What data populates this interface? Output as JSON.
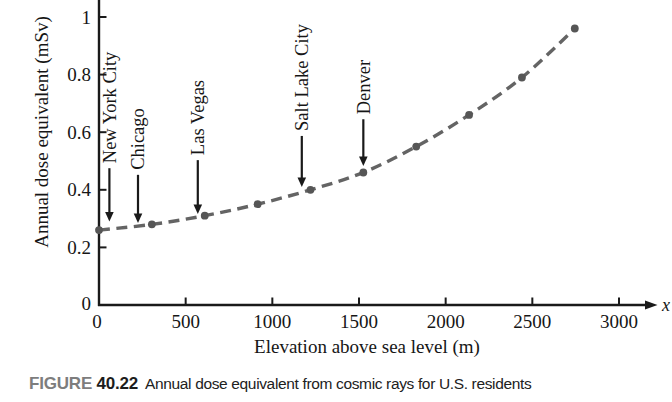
{
  "figure_caption": {
    "tag": "FIGURE",
    "number": "40.22",
    "text": "Annual dose equivalent from cosmic rays for U.S. residents"
  },
  "chart_data": {
    "type": "line",
    "title": "",
    "xlabel": "Elevation above sea level (m)",
    "ylabel": "Annual dose equivalent (mSv)",
    "x_axis_end_symbol": "x",
    "xlim": [
      0,
      3100
    ],
    "ylim": [
      0,
      1.05
    ],
    "x_ticks": [
      0,
      500,
      1000,
      1500,
      2000,
      2500,
      3000
    ],
    "y_ticks": [
      0,
      0.2,
      0.4,
      0.6,
      0.8,
      1
    ],
    "grid": false,
    "legend": "none",
    "line_style": "dashed",
    "colors": {
      "curve": "#646464",
      "points": "#565656",
      "axis": "#1a1a1a",
      "text": "#161616"
    },
    "points": [
      {
        "elevation_m": 0,
        "dose_mSv": 0.26
      },
      {
        "elevation_m": 305,
        "dose_mSv": 0.28
      },
      {
        "elevation_m": 610,
        "dose_mSv": 0.31
      },
      {
        "elevation_m": 915,
        "dose_mSv": 0.35
      },
      {
        "elevation_m": 1220,
        "dose_mSv": 0.4
      },
      {
        "elevation_m": 1525,
        "dose_mSv": 0.46
      },
      {
        "elevation_m": 1830,
        "dose_mSv": 0.55
      },
      {
        "elevation_m": 2135,
        "dose_mSv": 0.66
      },
      {
        "elevation_m": 2440,
        "dose_mSv": 0.79
      },
      {
        "elevation_m": 2745,
        "dose_mSv": 0.96
      }
    ],
    "annotations": [
      {
        "label": "New York City",
        "elevation_m": 60,
        "arrow_tip_dose": 0.29,
        "arrow_tail_dose": 0.475
      },
      {
        "label": "Chicago",
        "elevation_m": 225,
        "arrow_tip_dose": 0.285,
        "arrow_tail_dose": 0.452
      },
      {
        "label": "Las Vegas",
        "elevation_m": 570,
        "arrow_tip_dose": 0.316,
        "arrow_tail_dose": 0.503
      },
      {
        "label": "Salt Lake City",
        "elevation_m": 1170,
        "arrow_tip_dose": 0.41,
        "arrow_tail_dose": 0.587
      },
      {
        "label": "Denver",
        "elevation_m": 1525,
        "arrow_tip_dose": 0.483,
        "arrow_tail_dose": 0.645
      }
    ]
  }
}
